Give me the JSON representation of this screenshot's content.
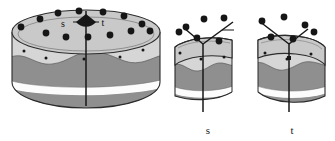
{
  "figure": {
    "type": "diagram",
    "background": "#ffffff",
    "colors": {
      "frosting_top": "#c9c9c9",
      "frosting_side": "#d2d2d2",
      "cake_dark": "#8c8c8c",
      "cake_dark2": "#8c8c8c",
      "cream_white": "#fbfbfb",
      "outline": "#2b2b2b",
      "sprinkle": "#1a1a1a",
      "wedge_fill": "#171717",
      "label_text": "#1a1a1a"
    }
  },
  "whole_cake": {
    "name": "whole-layered-cake",
    "top_labels": [
      {
        "text": "s",
        "x": 63,
        "y": 24
      },
      {
        "text": "t",
        "x": 98,
        "y": 23
      }
    ],
    "cut_line": {
      "label": "vertical-cut-line",
      "x": 86,
      "y1": 14,
      "y2": 106
    },
    "angle_wedge": {
      "label": "center-angle-wedge",
      "cx": 86,
      "cy": 14,
      "radius": 11
    },
    "sprinkles_outer": [
      [
        40,
        19
      ],
      [
        58,
        13
      ],
      [
        79,
        11
      ],
      [
        103,
        12
      ],
      [
        124,
        16
      ],
      [
        142,
        24
      ],
      [
        27,
        28
      ],
      [
        46,
        33
      ],
      [
        66,
        36
      ],
      [
        88,
        36
      ],
      [
        110,
        34
      ],
      [
        131,
        30
      ],
      [
        147,
        31
      ]
    ],
    "sprinkles_side": [
      [
        24,
        51
      ],
      [
        46,
        57
      ],
      [
        84,
        58
      ],
      [
        120,
        57
      ],
      [
        143,
        50
      ]
    ],
    "layers": [
      {
        "name": "frosting-top-ellipse",
        "tone": "light"
      },
      {
        "name": "frosting-drip-band",
        "tone": "light"
      },
      {
        "name": "sponge-upper",
        "tone": "dark"
      },
      {
        "name": "cream-filling",
        "tone": "white"
      },
      {
        "name": "sponge-lower",
        "tone": "dark"
      }
    ]
  },
  "half_cake_s": {
    "name": "half-cake-s",
    "label": "s",
    "label_pos": {
      "x": 208,
      "y": 132
    },
    "cut_line": {
      "label": "vertical-cut-line",
      "x": 203,
      "y1": 42,
      "y2": 112
    },
    "wedge_lines": [
      {
        "x1": 203,
        "y1": 42,
        "x2": 230,
        "y2": 22
      },
      {
        "x1": 203,
        "y1": 42,
        "x2": 186,
        "y2": 28
      }
    ],
    "sprinkles_outer": [
      [
        186,
        26
      ],
      [
        202,
        18
      ],
      [
        222,
        16
      ],
      [
        196,
        37
      ],
      [
        216,
        38
      ],
      [
        230,
        32
      ]
    ],
    "sprinkles_side": [
      [
        182,
        52
      ],
      [
        204,
        58
      ],
      [
        226,
        55
      ]
    ]
  },
  "half_cake_t": {
    "name": "half-cake-t",
    "label": "t",
    "label_pos": {
      "x": 292,
      "y": 132
    },
    "cut_line": {
      "label": "vertical-cut-line",
      "x": 289,
      "y1": 42,
      "y2": 112
    },
    "wedge_lines": [
      {
        "x1": 289,
        "y1": 42,
        "x2": 262,
        "y2": 20
      },
      {
        "x1": 289,
        "y1": 42,
        "x2": 306,
        "y2": 28
      }
    ],
    "sprinkles_outer": [
      [
        262,
        20
      ],
      [
        283,
        16
      ],
      [
        304,
        24
      ],
      [
        270,
        36
      ],
      [
        292,
        38
      ],
      [
        312,
        31
      ]
    ],
    "sprinkles_side": [
      [
        266,
        52
      ],
      [
        288,
        58
      ],
      [
        310,
        53
      ]
    ]
  }
}
